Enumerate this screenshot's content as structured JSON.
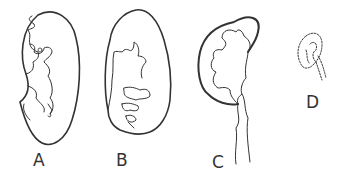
{
  "figure": {
    "panels": [
      {
        "id": "A",
        "label": "A",
        "x": 42,
        "y": 160
      },
      {
        "id": "B",
        "label": "B",
        "x": 118,
        "y": 160
      },
      {
        "id": "C",
        "label": "C",
        "x": 211,
        "y": 160
      },
      {
        "id": "D",
        "label": "D",
        "x": 305,
        "y": 92
      }
    ]
  },
  "colors": {
    "stroke": "#333333",
    "background": "#ffffff"
  }
}
